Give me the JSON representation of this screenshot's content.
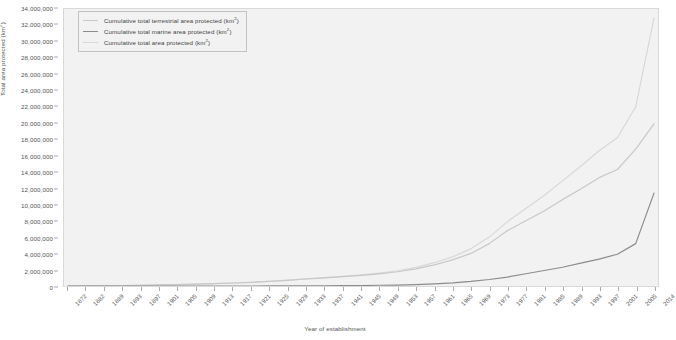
{
  "chart_data": {
    "type": "line",
    "title": "",
    "xlabel": "Year of establishment",
    "ylabel": "Total area protected (km²)",
    "ylim": [
      0,
      34000000
    ],
    "ytick_step": 2000000,
    "yticks": [
      0,
      2000000,
      4000000,
      6000000,
      8000000,
      10000000,
      12000000,
      14000000,
      16000000,
      18000000,
      20000000,
      22000000,
      24000000,
      26000000,
      28000000,
      30000000,
      32000000,
      34000000
    ],
    "ytick_labels": [
      "0",
      "2,000,000",
      "4,000,000",
      "6,000,000",
      "8,000,000",
      "10,000,000",
      "12,000,000",
      "14,000,000",
      "16,000,000",
      "18,000,000",
      "20,000,000",
      "22,000,000",
      "24,000,000",
      "26,000,000",
      "28,000,000",
      "30,000,000",
      "32,000,000",
      "34,000,000"
    ],
    "grid": false,
    "legend_position": "top-left",
    "xtick_labels": [
      "1872",
      "1882",
      "1889",
      "1893",
      "1897",
      "1901",
      "1905",
      "1909",
      "1913",
      "1917",
      "1921",
      "1925",
      "1929",
      "1933",
      "1937",
      "1941",
      "1945",
      "1949",
      "1953",
      "1957",
      "1961",
      "1965",
      "1969",
      "1973",
      "1977",
      "1981",
      "1985",
      "1989",
      "1993",
      "1997",
      "2001",
      "2005",
      "2014"
    ],
    "x": [
      1872,
      1882,
      1889,
      1893,
      1897,
      1901,
      1905,
      1909,
      1913,
      1917,
      1921,
      1925,
      1929,
      1933,
      1937,
      1941,
      1945,
      1949,
      1953,
      1957,
      1961,
      1965,
      1969,
      1973,
      1977,
      1981,
      1985,
      1989,
      1993,
      1997,
      2001,
      2005,
      2014
    ],
    "series": [
      {
        "name": "Cumulative total terrestrial area protected (km²)",
        "color": "#c8c8c8",
        "values": [
          10000,
          20000,
          40000,
          60000,
          90000,
          130000,
          180000,
          240000,
          300000,
          370000,
          450000,
          560000,
          700000,
          860000,
          1000000,
          1150000,
          1300000,
          1500000,
          1750000,
          2100000,
          2600000,
          3200000,
          4000000,
          5200000,
          6800000,
          8000000,
          9200000,
          10600000,
          11900000,
          13300000,
          14300000,
          16800000,
          19900000
        ]
      },
      {
        "name": "Cumulative total marine area protected (km²)",
        "color": "#8c8c8c",
        "values": [
          0,
          0,
          0,
          0,
          0,
          0,
          0,
          0,
          0,
          0,
          0,
          5000,
          10000,
          20000,
          30000,
          40000,
          60000,
          90000,
          120000,
          180000,
          260000,
          380000,
          560000,
          800000,
          1100000,
          1500000,
          1900000,
          2300000,
          2800000,
          3300000,
          3900000,
          5200000,
          11400000
        ]
      },
      {
        "name": "Cumulative total area protected (km²)",
        "color": "#d8d8d8",
        "values": [
          10000,
          20000,
          40000,
          60000,
          90000,
          130000,
          180000,
          240000,
          300000,
          370000,
          450000,
          565000,
          710000,
          880000,
          1030000,
          1190000,
          1360000,
          1590000,
          1870000,
          2280000,
          2860000,
          3580000,
          4560000,
          6000000,
          7900000,
          9500000,
          11100000,
          12900000,
          14700000,
          16600000,
          18200000,
          22000000,
          32900000
        ]
      }
    ]
  },
  "legend": {
    "items": [
      {
        "label_main": "Cumulative total terrestrial area protected (km",
        "label_sup": "2",
        "label_end": ")"
      },
      {
        "label_main": "Cumulative total marine area protected (km",
        "label_sup": "2",
        "label_end": ")"
      },
      {
        "label_main": "Cumulative total area protected (km",
        "label_sup": "2",
        "label_end": ")"
      }
    ]
  },
  "axes": {
    "y_title_main": "Total area protected (km",
    "y_title_sup": "2",
    "y_title_end": ")",
    "x_title": "Year of establishment"
  }
}
